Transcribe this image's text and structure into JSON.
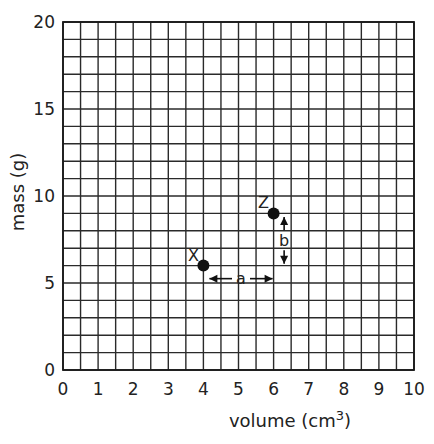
{
  "chart_data": {
    "type": "scatter",
    "title": "",
    "xlabel": "volume (cm³)",
    "xlabel_base": "volume (cm",
    "xlabel_sup": "3",
    "xlabel_close": ")",
    "ylabel": "mass (g)",
    "xlim": [
      0,
      10
    ],
    "ylim": [
      0,
      20
    ],
    "x_ticks": [
      "0",
      "1",
      "2",
      "3",
      "4",
      "5",
      "6",
      "7",
      "8",
      "9",
      "10"
    ],
    "y_ticks": [
      "0",
      "5",
      "10",
      "15",
      "20"
    ],
    "y_tick_values": [
      0,
      5,
      10,
      15,
      20
    ],
    "x_minor_step": 0.5,
    "y_minor_step": 1,
    "grid": true,
    "legend": null,
    "series": [
      {
        "name": "points",
        "points": [
          {
            "label": "X",
            "x": 4,
            "y": 6
          },
          {
            "label": "Z",
            "x": 6,
            "y": 9
          }
        ]
      }
    ],
    "annotations": [
      {
        "label": "a",
        "type": "horizontal-double-arrow",
        "from": [
          4,
          5.25
        ],
        "to": [
          6,
          5.25
        ],
        "represents": "change in volume (Δx = 2)"
      },
      {
        "label": "b",
        "type": "vertical-double-arrow",
        "from": [
          6.3,
          6.1
        ],
        "to": [
          6.3,
          8.8
        ],
        "represents": "change in mass (Δy = 3)"
      }
    ]
  },
  "colors": {
    "grid": "#2a2a2a",
    "points": "#111111",
    "background": "#ffffff"
  }
}
